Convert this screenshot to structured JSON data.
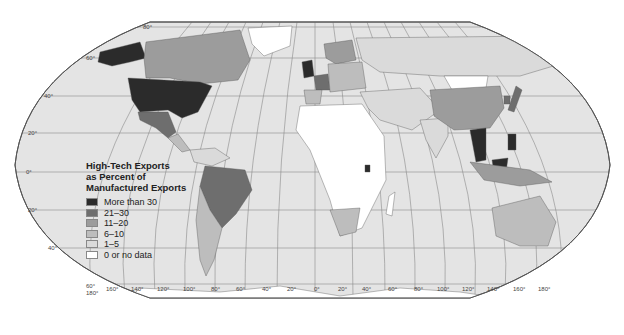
{
  "legend": {
    "title_line1": "High-Tech Exports",
    "title_line2": "as Percent of",
    "title_line3": "Manufactured Exports",
    "items": [
      {
        "label": "More than 30",
        "color": "#2b2b2b"
      },
      {
        "label": "21–30",
        "color": "#6e6e6e"
      },
      {
        "label": "11–20",
        "color": "#9c9c9c"
      },
      {
        "label": "6–10",
        "color": "#bdbdbd"
      },
      {
        "label": "1–5",
        "color": "#dadada"
      },
      {
        "label": "0 or no data",
        "color": "#ffffff"
      }
    ]
  },
  "latitude_labels": [
    "80°",
    "60°",
    "40°",
    "20°",
    "0°",
    "20°",
    "40°",
    "60°"
  ],
  "longitude_labels": [
    "180°",
    "160°",
    "140°",
    "120°",
    "100°",
    "80°",
    "60°",
    "40°",
    "20°",
    "0°",
    "20°",
    "40°",
    "60°",
    "80°",
    "100°",
    "120°",
    "140°",
    "160°",
    "180°"
  ],
  "colors": {
    "ocean": "#e4e4e4",
    "graticule": "#8a8a8a",
    "border": "#555555"
  }
}
